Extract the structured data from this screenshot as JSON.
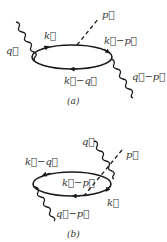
{
  "diagrams": [
    {
      "caption": "(a)",
      "labels": {
        "q": "q⃗",
        "k": "k⃗",
        "p": "p⃗",
        "k_minus_p": "k⃗−p⃗",
        "k_minus_q": "k⃗−q⃗",
        "q_minus_p": "q⃗−p⃗"
      }
    },
    {
      "caption": "(b)",
      "labels": {
        "q": "q⃗",
        "p": "p⃗",
        "k_minus_q": "k⃗−q⃗",
        "k_minus_p": "k⃗−p⃗",
        "k": "k⃗",
        "q_minus_p": "q⃗−p⃗"
      }
    }
  ],
  "colors": {
    "line": "#1a1a1a",
    "text": "#333333",
    "background": "#ffffff"
  }
}
